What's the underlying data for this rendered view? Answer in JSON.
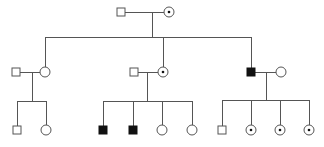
{
  "diagram": {
    "type": "pedigree",
    "legend_text": "",
    "colors": {
      "line": "#555555",
      "affected": "#111111",
      "unaffected": "#ffffff",
      "carrier_dot": "#111111"
    },
    "generations": [
      {
        "label": "I",
        "individuals": [
          {
            "id": "I-1",
            "sex": "male",
            "status": "unaffected",
            "x": 121,
            "y": 12
          },
          {
            "id": "I-2",
            "sex": "female",
            "status": "carrier",
            "x": 169,
            "y": 12
          }
        ]
      },
      {
        "label": "II",
        "individuals": [
          {
            "id": "II-1",
            "sex": "male",
            "status": "unaffected",
            "x": 16,
            "y": 72,
            "note": "married-in"
          },
          {
            "id": "II-2",
            "sex": "female",
            "status": "unaffected",
            "x": 45,
            "y": 72
          },
          {
            "id": "II-3",
            "sex": "male",
            "status": "unaffected",
            "x": 134,
            "y": 72,
            "note": "married-in"
          },
          {
            "id": "II-4",
            "sex": "female",
            "status": "carrier",
            "x": 163,
            "y": 72
          },
          {
            "id": "II-5",
            "sex": "male",
            "status": "affected",
            "x": 251,
            "y": 72
          },
          {
            "id": "II-6",
            "sex": "female",
            "status": "unaffected",
            "x": 281,
            "y": 72,
            "note": "married-in"
          }
        ]
      },
      {
        "label": "III",
        "individuals": [
          {
            "id": "III-1",
            "sex": "male",
            "status": "unaffected",
            "x": 17,
            "y": 130
          },
          {
            "id": "III-2",
            "sex": "female",
            "status": "unaffected",
            "x": 46,
            "y": 130
          },
          {
            "id": "III-3",
            "sex": "male",
            "status": "affected",
            "x": 103,
            "y": 130
          },
          {
            "id": "III-4",
            "sex": "male",
            "status": "affected",
            "x": 133,
            "y": 130
          },
          {
            "id": "III-5",
            "sex": "female",
            "status": "unaffected",
            "x": 162,
            "y": 130
          },
          {
            "id": "III-6",
            "sex": "female",
            "status": "unaffected",
            "x": 192,
            "y": 130
          },
          {
            "id": "III-7",
            "sex": "male",
            "status": "unaffected",
            "x": 222,
            "y": 130
          },
          {
            "id": "III-8",
            "sex": "female",
            "status": "carrier",
            "x": 251,
            "y": 130
          },
          {
            "id": "III-9",
            "sex": "female",
            "status": "carrier",
            "x": 280,
            "y": 130
          },
          {
            "id": "III-10",
            "sex": "female",
            "status": "carrier",
            "x": 309,
            "y": 130
          }
        ]
      }
    ]
  }
}
